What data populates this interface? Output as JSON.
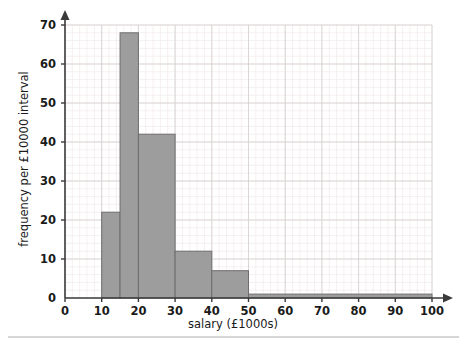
{
  "chart_data": {
    "type": "bar",
    "title": "",
    "subtitle": "",
    "xlabel": "salary (£1000s)",
    "ylabel": "frequency per £10000 interval",
    "xlim": [
      0,
      100
    ],
    "ylim": [
      0,
      70
    ],
    "grid": true,
    "legend": null,
    "legend_position": "none",
    "histogram": true,
    "x_ticks": [
      0,
      10,
      20,
      30,
      40,
      50,
      60,
      70,
      80,
      90,
      100
    ],
    "x_tick_labels": [
      "0",
      "10",
      "20",
      "30",
      "40",
      "50",
      "60",
      "70",
      "80",
      "90",
      "100"
    ],
    "y_ticks": [
      0,
      10,
      20,
      30,
      40,
      50,
      60,
      70
    ],
    "y_tick_labels": [
      "0",
      "10",
      "20",
      "30",
      "40",
      "50",
      "60",
      "70"
    ],
    "bars": [
      {
        "label": "10-15",
        "x0": 10,
        "x1": 15,
        "value": 22
      },
      {
        "label": "15-20",
        "x0": 15,
        "x1": 20,
        "value": 68
      },
      {
        "label": "20-30",
        "x0": 20,
        "x1": 30,
        "value": 42
      },
      {
        "label": "30-40",
        "x0": 30,
        "x1": 40,
        "value": 12
      },
      {
        "label": "40-50",
        "x0": 40,
        "x1": 50,
        "value": 7
      },
      {
        "label": "50-100",
        "x0": 50,
        "x1": 100,
        "value": 1
      }
    ],
    "categories": [
      "10-15",
      "15-20",
      "20-30",
      "30-40",
      "40-50",
      "50-100"
    ],
    "values": [
      22,
      68,
      42,
      12,
      7,
      1
    ],
    "colors": {
      "bar_fill": "#9d9d9d",
      "bar_stroke": "#6e6e6e",
      "axis": "#3a3a3a",
      "grid_minor": "#f0e6e6",
      "grid_major": "#d8d2d2",
      "text": "#1a1a1a",
      "background": "#ffffff",
      "footer_rule": "#c9c9c9"
    }
  },
  "figure": {
    "name": "salary-histogram",
    "axis_arrow_x": "arrow-right",
    "axis_arrow_y": "arrow-up"
  }
}
